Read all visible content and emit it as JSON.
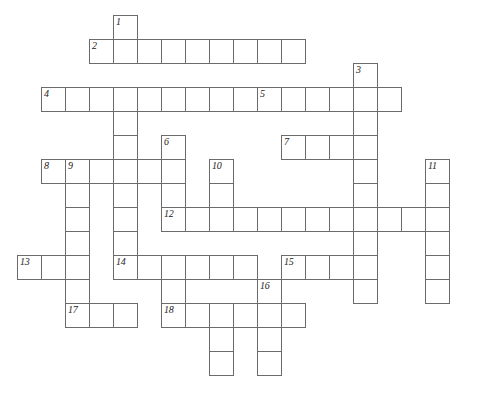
{
  "puzzle": {
    "title": "Crossword Grid",
    "type": "crossword-grid",
    "cell_size": 24,
    "grid_origin": {
      "x": 17,
      "y": 15
    },
    "colors": {
      "cell_border": "#6b6b6b",
      "cell_fill": "#ffffff",
      "number_text": "#1a1a1a",
      "page_background": "#ffffff"
    },
    "entries": [
      {
        "number": "1",
        "direction": "down",
        "col": 4,
        "row": 0,
        "length": 9
      },
      {
        "number": "2",
        "direction": "across",
        "col": 3,
        "row": 1,
        "length": 9
      },
      {
        "number": "3",
        "direction": "down",
        "col": 14,
        "row": 2,
        "length": 9
      },
      {
        "number": "4",
        "direction": "across",
        "col": 1,
        "row": 3,
        "length": 9
      },
      {
        "number": "5",
        "direction": "across",
        "col": 10,
        "row": 3,
        "length": 6
      },
      {
        "number": "6",
        "direction": "down",
        "col": 6,
        "row": 5,
        "length": 3
      },
      {
        "number": "7",
        "direction": "across",
        "col": 11,
        "row": 5,
        "length": 4
      },
      {
        "number": "8",
        "direction": "across",
        "col": 1,
        "row": 6,
        "length": 5
      },
      {
        "number": "9",
        "direction": "down",
        "col": 2,
        "row": 6,
        "length": 7
      },
      {
        "number": "10",
        "direction": "down",
        "col": 8,
        "row": 6,
        "length": 3
      },
      {
        "number": "11",
        "direction": "down",
        "col": 17,
        "row": 6,
        "length": 6
      },
      {
        "number": "12",
        "direction": "across",
        "col": 6,
        "row": 8,
        "length": 12
      },
      {
        "number": "13",
        "direction": "across",
        "col": 0,
        "row": 10,
        "length": 3
      },
      {
        "number": "14",
        "direction": "across",
        "col": 4,
        "row": 10,
        "length": 6
      },
      {
        "number": "15",
        "direction": "across",
        "col": 11,
        "row": 10,
        "length": 4
      },
      {
        "number": "16",
        "direction": "down",
        "col": 10,
        "row": 11,
        "length": 5
      },
      {
        "number": "17",
        "direction": "across",
        "col": 2,
        "row": 12,
        "length": 3
      },
      {
        "number": "18",
        "direction": "across",
        "col": 6,
        "row": 12,
        "length": 6
      }
    ],
    "cells": [
      {
        "col": 4,
        "row": 0,
        "number": "1"
      },
      {
        "col": 4,
        "row": 1,
        "number": ""
      },
      {
        "col": 3,
        "row": 1,
        "number": "2"
      },
      {
        "col": 5,
        "row": 1,
        "number": ""
      },
      {
        "col": 6,
        "row": 1,
        "number": ""
      },
      {
        "col": 7,
        "row": 1,
        "number": ""
      },
      {
        "col": 8,
        "row": 1,
        "number": ""
      },
      {
        "col": 9,
        "row": 1,
        "number": ""
      },
      {
        "col": 10,
        "row": 1,
        "number": ""
      },
      {
        "col": 11,
        "row": 1,
        "number": ""
      },
      {
        "col": 14,
        "row": 2,
        "number": "3"
      },
      {
        "col": 1,
        "row": 3,
        "number": "4"
      },
      {
        "col": 2,
        "row": 3,
        "number": ""
      },
      {
        "col": 3,
        "row": 3,
        "number": ""
      },
      {
        "col": 4,
        "row": 3,
        "number": ""
      },
      {
        "col": 5,
        "row": 3,
        "number": ""
      },
      {
        "col": 6,
        "row": 3,
        "number": ""
      },
      {
        "col": 7,
        "row": 3,
        "number": ""
      },
      {
        "col": 8,
        "row": 3,
        "number": ""
      },
      {
        "col": 9,
        "row": 3,
        "number": ""
      },
      {
        "col": 10,
        "row": 3,
        "number": "5"
      },
      {
        "col": 11,
        "row": 3,
        "number": ""
      },
      {
        "col": 12,
        "row": 3,
        "number": ""
      },
      {
        "col": 13,
        "row": 3,
        "number": ""
      },
      {
        "col": 14,
        "row": 3,
        "number": ""
      },
      {
        "col": 15,
        "row": 3,
        "number": ""
      },
      {
        "col": 4,
        "row": 4,
        "number": ""
      },
      {
        "col": 14,
        "row": 4,
        "number": ""
      },
      {
        "col": 6,
        "row": 5,
        "number": "6"
      },
      {
        "col": 4,
        "row": 5,
        "number": ""
      },
      {
        "col": 11,
        "row": 5,
        "number": "7"
      },
      {
        "col": 12,
        "row": 5,
        "number": ""
      },
      {
        "col": 13,
        "row": 5,
        "number": ""
      },
      {
        "col": 14,
        "row": 5,
        "number": ""
      },
      {
        "col": 1,
        "row": 6,
        "number": "8"
      },
      {
        "col": 2,
        "row": 6,
        "number": "9"
      },
      {
        "col": 3,
        "row": 6,
        "number": ""
      },
      {
        "col": 4,
        "row": 6,
        "number": ""
      },
      {
        "col": 5,
        "row": 6,
        "number": ""
      },
      {
        "col": 6,
        "row": 6,
        "number": ""
      },
      {
        "col": 8,
        "row": 6,
        "number": "10"
      },
      {
        "col": 14,
        "row": 6,
        "number": ""
      },
      {
        "col": 17,
        "row": 6,
        "number": "11"
      },
      {
        "col": 2,
        "row": 7,
        "number": ""
      },
      {
        "col": 4,
        "row": 7,
        "number": ""
      },
      {
        "col": 6,
        "row": 7,
        "number": ""
      },
      {
        "col": 8,
        "row": 7,
        "number": ""
      },
      {
        "col": 14,
        "row": 7,
        "number": ""
      },
      {
        "col": 17,
        "row": 7,
        "number": ""
      },
      {
        "col": 6,
        "row": 8,
        "number": "12"
      },
      {
        "col": 7,
        "row": 8,
        "number": ""
      },
      {
        "col": 8,
        "row": 8,
        "number": ""
      },
      {
        "col": 9,
        "row": 8,
        "number": ""
      },
      {
        "col": 10,
        "row": 8,
        "number": ""
      },
      {
        "col": 11,
        "row": 8,
        "number": ""
      },
      {
        "col": 12,
        "row": 8,
        "number": ""
      },
      {
        "col": 13,
        "row": 8,
        "number": ""
      },
      {
        "col": 14,
        "row": 8,
        "number": ""
      },
      {
        "col": 15,
        "row": 8,
        "number": ""
      },
      {
        "col": 16,
        "row": 8,
        "number": ""
      },
      {
        "col": 17,
        "row": 8,
        "number": ""
      },
      {
        "col": 2,
        "row": 8,
        "number": ""
      },
      {
        "col": 4,
        "row": 8,
        "number": ""
      },
      {
        "col": 2,
        "row": 9,
        "number": ""
      },
      {
        "col": 4,
        "row": 9,
        "number": ""
      },
      {
        "col": 14,
        "row": 9,
        "number": ""
      },
      {
        "col": 17,
        "row": 9,
        "number": ""
      },
      {
        "col": 0,
        "row": 10,
        "number": "13"
      },
      {
        "col": 1,
        "row": 10,
        "number": ""
      },
      {
        "col": 2,
        "row": 10,
        "number": ""
      },
      {
        "col": 4,
        "row": 10,
        "number": "14"
      },
      {
        "col": 5,
        "row": 10,
        "number": ""
      },
      {
        "col": 6,
        "row": 10,
        "number": ""
      },
      {
        "col": 7,
        "row": 10,
        "number": ""
      },
      {
        "col": 8,
        "row": 10,
        "number": ""
      },
      {
        "col": 9,
        "row": 10,
        "number": ""
      },
      {
        "col": 11,
        "row": 10,
        "number": "15"
      },
      {
        "col": 12,
        "row": 10,
        "number": ""
      },
      {
        "col": 13,
        "row": 10,
        "number": ""
      },
      {
        "col": 14,
        "row": 10,
        "number": ""
      },
      {
        "col": 17,
        "row": 10,
        "number": ""
      },
      {
        "col": 10,
        "row": 11,
        "number": "16"
      },
      {
        "col": 2,
        "row": 11,
        "number": ""
      },
      {
        "col": 6,
        "row": 11,
        "number": ""
      },
      {
        "col": 14,
        "row": 11,
        "number": ""
      },
      {
        "col": 17,
        "row": 11,
        "number": ""
      },
      {
        "col": 2,
        "row": 12,
        "number": "17"
      },
      {
        "col": 3,
        "row": 12,
        "number": ""
      },
      {
        "col": 4,
        "row": 12,
        "number": ""
      },
      {
        "col": 6,
        "row": 12,
        "number": "18"
      },
      {
        "col": 7,
        "row": 12,
        "number": ""
      },
      {
        "col": 8,
        "row": 12,
        "number": ""
      },
      {
        "col": 9,
        "row": 12,
        "number": ""
      },
      {
        "col": 10,
        "row": 12,
        "number": ""
      },
      {
        "col": 11,
        "row": 12,
        "number": ""
      },
      {
        "col": 8,
        "row": 13,
        "number": ""
      },
      {
        "col": 10,
        "row": 13,
        "number": ""
      },
      {
        "col": 8,
        "row": 14,
        "number": ""
      },
      {
        "col": 10,
        "row": 14,
        "number": ""
      }
    ]
  }
}
